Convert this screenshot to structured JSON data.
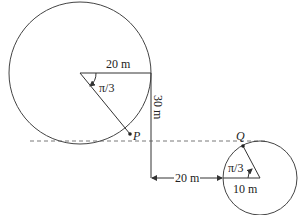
{
  "figure": {
    "large_circle": {
      "radius_label": "20 m",
      "angle_label": "π/3",
      "point_label": "P"
    },
    "small_circle": {
      "radius_label": "10 m",
      "angle_label": "π/3",
      "point_label": "Q"
    },
    "vertical_distance_label": "30 m",
    "horizontal_distance_label": "20 m"
  }
}
